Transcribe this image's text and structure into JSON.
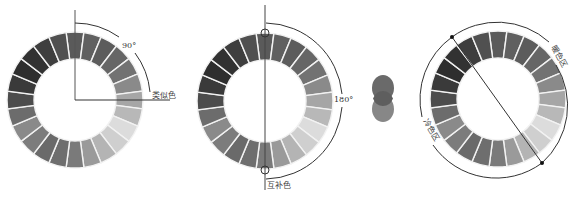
{
  "figure": {
    "segment_count": 24,
    "segment_grays": [
      "#5a5a5a",
      "#606060",
      "#5c5c5c",
      "#666666",
      "#727272",
      "#8a8a8a",
      "#a6a6a6",
      "#b8b8b8",
      "#dcdcdc",
      "#cfcfcf",
      "#b4b4b4",
      "#9a9a9a",
      "#7a7a7a",
      "#6e6e6e",
      "#6a6a6a",
      "#7c7c7c",
      "#8a8a8a",
      "#6c6c6c",
      "#4c4c4c",
      "#3a3a3a",
      "#2e2e2e",
      "#323232",
      "#3e3e3e",
      "#505050"
    ],
    "line_color": "#333333",
    "gap_color": "#f2f2f2"
  },
  "wheels": [
    {
      "id": "analogous",
      "center": [
        75,
        100
      ],
      "outer_r": 68,
      "inner_r": 41,
      "angle_label": "90°",
      "term_label": "类似色"
    },
    {
      "id": "complementary",
      "center": [
        265,
        101
      ],
      "outer_r": 68,
      "inner_r": 41,
      "angle_label": "180°",
      "term_label": "互补色"
    },
    {
      "id": "warm-cool",
      "center": [
        498,
        99
      ],
      "outer_r": 68,
      "inner_r": 41,
      "warm_label": "暖色区",
      "cool_label": "冷色区"
    }
  ],
  "overlap_circles": {
    "top": {
      "center": [
        383,
        88
      ],
      "r": 12,
      "color": "#6a6a6a"
    },
    "bottom": {
      "center": [
        383,
        109
      ],
      "r": 12,
      "color": "#7a7a7a"
    },
    "overlap_color": "#5e5e5e"
  }
}
